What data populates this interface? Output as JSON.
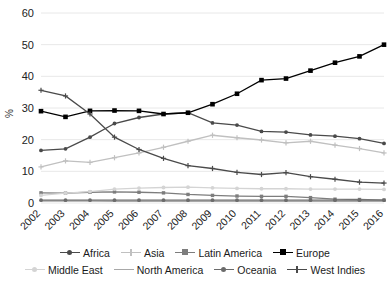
{
  "chart_data": {
    "type": "line",
    "title": "",
    "subtitle": "",
    "xlabel": "",
    "ylabel": "%",
    "x": [
      "2002",
      "2003",
      "2004",
      "2005",
      "2006",
      "2007",
      "2008",
      "2009",
      "2010",
      "2011",
      "2012",
      "2013",
      "2014",
      "2015",
      "2016"
    ],
    "categories": [
      "2002",
      "2003",
      "2004",
      "2005",
      "2006",
      "2007",
      "2008",
      "2009",
      "2010",
      "2011",
      "2012",
      "2013",
      "2014",
      "2015",
      "2016"
    ],
    "ylim": [
      0,
      60
    ],
    "yticks": [
      0,
      10,
      20,
      30,
      40,
      50,
      60
    ],
    "grid": true,
    "legend_position": "bottom",
    "series": [
      {
        "name": "Africa",
        "color": "#4a4a4a",
        "marker": "dot",
        "values": [
          16.6,
          17.1,
          20.8,
          25.1,
          27.0,
          28.1,
          28.5,
          25.3,
          24.6,
          22.6,
          22.4,
          21.5,
          21.1,
          20.3,
          18.8
        ]
      },
      {
        "name": "Asia",
        "color": "#c0c0c0",
        "marker": "plus",
        "values": [
          11.4,
          13.3,
          12.8,
          14.3,
          15.8,
          17.6,
          19.5,
          21.4,
          20.6,
          19.9,
          19.0,
          19.5,
          18.3,
          17.2,
          15.8
        ]
      },
      {
        "name": "Latin America",
        "color": "#7d7d7d",
        "marker": "square",
        "values": [
          3.2,
          3.1,
          3.4,
          3.5,
          3.4,
          3.2,
          2.7,
          2.4,
          2.2,
          2.1,
          2.1,
          1.7,
          1.2,
          1.1,
          0.9
        ]
      },
      {
        "name": "Europe",
        "color": "#000000",
        "marker": "square",
        "values": [
          29.0,
          27.2,
          29.1,
          29.2,
          29.1,
          28.1,
          28.5,
          31.2,
          34.5,
          38.8,
          39.3,
          41.8,
          44.3,
          46.3,
          50.0
        ]
      },
      {
        "name": "Middle East",
        "color": "#d4d4d4",
        "marker": "dot",
        "values": [
          2.4,
          3.1,
          3.6,
          4.4,
          4.7,
          4.9,
          5.0,
          4.8,
          4.6,
          4.5,
          4.5,
          4.4,
          4.4,
          4.4,
          4.3
        ]
      },
      {
        "name": "North America",
        "color": "#a8a8a8",
        "marker": "none",
        "values": [
          0.6,
          0.6,
          0.6,
          0.5,
          0.5,
          0.5,
          0.5,
          0.5,
          0.5,
          0.5,
          0.5,
          0.5,
          0.5,
          0.5,
          0.5
        ]
      },
      {
        "name": "Oceania",
        "color": "#6b6b6b",
        "marker": "dot",
        "values": [
          0.9,
          0.9,
          0.9,
          0.9,
          0.9,
          0.9,
          0.9,
          0.9,
          0.9,
          0.9,
          0.9,
          0.9,
          0.9,
          0.9,
          0.9
        ]
      },
      {
        "name": "West Indies",
        "color": "#4a4a4a",
        "marker": "plus",
        "values": [
          35.6,
          33.8,
          28.1,
          20.8,
          16.9,
          14.1,
          11.8,
          10.9,
          9.7,
          9.0,
          9.6,
          8.3,
          7.5,
          6.6,
          6.3
        ]
      }
    ]
  },
  "axis": {
    "y_tick_labels": [
      "60",
      "50",
      "40",
      "30",
      "20",
      "10",
      "0"
    ],
    "y_axis_title": "%",
    "x_tick_labels": [
      "2002",
      "2003",
      "2004",
      "2005",
      "2006",
      "2007",
      "2008",
      "2009",
      "2010",
      "2011",
      "2012",
      "2013",
      "2014",
      "2015",
      "2016"
    ]
  },
  "legend": {
    "row1": [
      {
        "label": "Africa",
        "marker": "dot",
        "color": "#4a4a4a"
      },
      {
        "label": "Asia",
        "marker": "plus",
        "color": "#c0c0c0"
      },
      {
        "label": "Latin America",
        "marker": "square",
        "color": "#7d7d7d"
      },
      {
        "label": "Europe",
        "marker": "square",
        "color": "#000000"
      }
    ],
    "row2": [
      {
        "label": "Middle East",
        "marker": "dot",
        "color": "#d4d4d4"
      },
      {
        "label": "North America",
        "marker": "none",
        "color": "#a8a8a8"
      },
      {
        "label": "Oceania",
        "marker": "dot",
        "color": "#6b6b6b"
      },
      {
        "label": "West Indies",
        "marker": "plus",
        "color": "#4a4a4a"
      }
    ]
  },
  "colors": {
    "background": "#ffffff",
    "grid": "#e8e8e8",
    "text": "#1a1a1a"
  }
}
